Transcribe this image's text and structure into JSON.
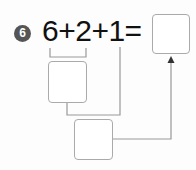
{
  "problem": {
    "number": "6",
    "expression": "6+2+1=",
    "answer_box_value": "",
    "step1_box_value": "",
    "step2_box_value": ""
  },
  "colors": {
    "badge": "#555555",
    "lines": "#999999",
    "box_border": "#aaaaaa"
  }
}
